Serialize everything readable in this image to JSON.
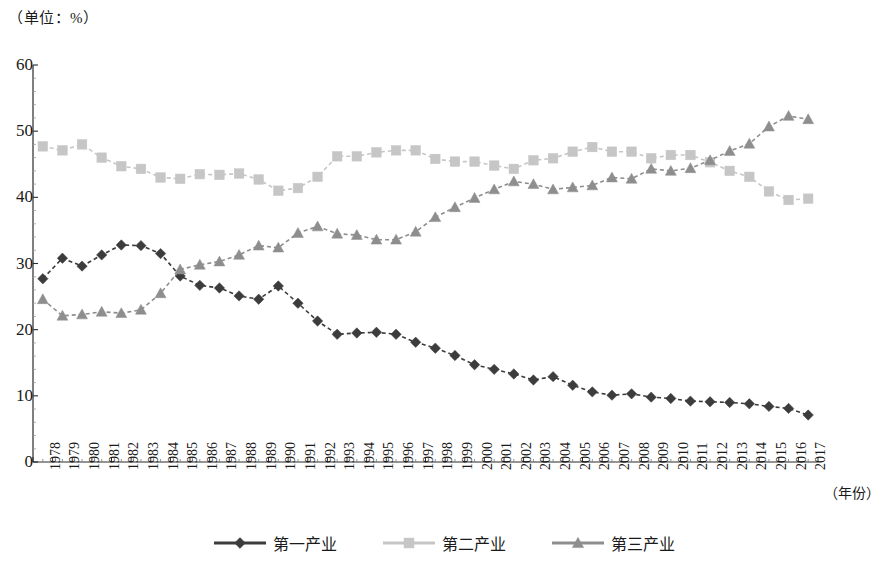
{
  "chart_data": {
    "type": "line",
    "title": "",
    "unit_label": "（单位：%）",
    "xlabel": "（年份）",
    "ylabel": "",
    "xlim": [
      1978,
      2017
    ],
    "ylim": [
      0,
      60
    ],
    "ytick_step": 10,
    "yticks": [
      0,
      10,
      20,
      30,
      40,
      50,
      60
    ],
    "grid": false,
    "legend_position": "bottom",
    "x": [
      1978,
      1979,
      1980,
      1981,
      1982,
      1983,
      1984,
      1985,
      1986,
      1987,
      1988,
      1989,
      1990,
      1991,
      1992,
      1993,
      1994,
      1995,
      1996,
      1997,
      1998,
      1999,
      2000,
      2001,
      2002,
      2003,
      2004,
      2005,
      2006,
      2007,
      2008,
      2009,
      2010,
      2011,
      2012,
      2013,
      2014,
      2015,
      2016,
      2017
    ],
    "categories": [
      "1978",
      "1979",
      "1980",
      "1981",
      "1982",
      "1983",
      "1984",
      "1985",
      "1986",
      "1987",
      "1988",
      "1989",
      "1990",
      "1991",
      "1992",
      "1993",
      "1994",
      "1995",
      "1996",
      "1997",
      "1998",
      "1999",
      "2000",
      "2001",
      "2002",
      "2003",
      "2004",
      "2005",
      "2006",
      "2007",
      "2008",
      "2009",
      "2010",
      "2011",
      "2012",
      "2013",
      "2014",
      "2015",
      "2016",
      "2017"
    ],
    "series": [
      {
        "name": "第一产业",
        "marker": "diamond",
        "color": "#3c3c3c",
        "values": [
          27.7,
          30.8,
          29.6,
          31.3,
          32.8,
          32.7,
          31.5,
          28.1,
          26.7,
          26.3,
          25.1,
          24.6,
          26.6,
          24.0,
          21.3,
          19.3,
          19.5,
          19.6,
          19.3,
          18.1,
          17.2,
          16.1,
          14.7,
          14.0,
          13.3,
          12.4,
          12.9,
          11.6,
          10.6,
          10.1,
          10.3,
          9.8,
          9.6,
          9.2,
          9.1,
          9.0,
          8.8,
          8.4,
          8.1,
          7.1
        ]
      },
      {
        "name": "第二产业",
        "marker": "square",
        "color": "#c6c6c6",
        "values": [
          47.7,
          47.1,
          48.0,
          46.0,
          44.7,
          44.3,
          43.0,
          42.8,
          43.5,
          43.4,
          43.6,
          42.7,
          41.0,
          41.4,
          43.1,
          46.2,
          46.2,
          46.8,
          47.1,
          47.1,
          45.8,
          45.4,
          45.4,
          44.8,
          44.3,
          45.6,
          45.9,
          46.9,
          47.6,
          46.9,
          46.9,
          45.9,
          46.4,
          46.4,
          45.3,
          44.0,
          43.1,
          40.9,
          39.6,
          39.8
        ]
      },
      {
        "name": "第三产业",
        "marker": "triangle",
        "color": "#8e8e8e",
        "values": [
          24.6,
          22.1,
          22.3,
          22.7,
          22.5,
          23.0,
          25.5,
          29.1,
          29.8,
          30.3,
          31.3,
          32.7,
          32.4,
          34.6,
          35.6,
          34.5,
          34.3,
          33.6,
          33.6,
          34.8,
          37.0,
          38.5,
          39.9,
          41.2,
          42.4,
          42.0,
          41.2,
          41.5,
          41.8,
          43.0,
          42.8,
          44.3,
          44.0,
          44.4,
          45.6,
          47.0,
          48.1,
          50.7,
          52.3,
          51.8
        ]
      }
    ]
  },
  "axis": {
    "y_labels": [
      "60",
      "50",
      "40",
      "30",
      "20",
      "10",
      "0"
    ],
    "x_labels": [
      "1978",
      "1979",
      "1980",
      "1981",
      "1982",
      "1983",
      "1984",
      "1985",
      "1986",
      "1987",
      "1988",
      "1989",
      "1990",
      "1991",
      "1992",
      "1993",
      "1994",
      "1995",
      "1996",
      "1997",
      "1998",
      "1999",
      "2000",
      "2001",
      "2002",
      "2003",
      "2004",
      "2005",
      "2006",
      "2007",
      "2008",
      "2009",
      "2010",
      "2011",
      "2012",
      "2013",
      "2014",
      "2015",
      "2016",
      "2017"
    ],
    "unit_label": "（单位：%）",
    "x_title": "（年份）"
  },
  "legend": {
    "items": [
      {
        "label": "第一产业",
        "color": "#3c3c3c",
        "marker": "diamond"
      },
      {
        "label": "第二产业",
        "color": "#c6c6c6",
        "marker": "square"
      },
      {
        "label": "第三产业",
        "color": "#8e8e8e",
        "marker": "triangle"
      }
    ]
  }
}
